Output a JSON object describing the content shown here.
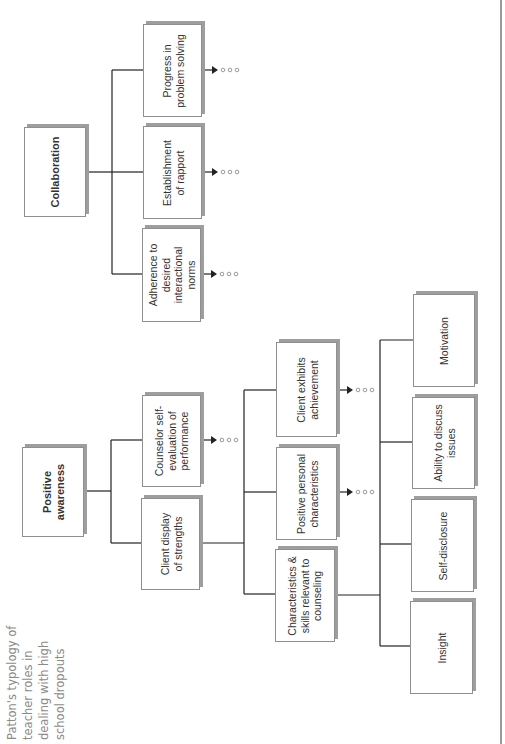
{
  "caption": "Patton's typology of teacher roles in dealing with high school dropouts",
  "diagram": {
    "orientation": "rotated-90-ccw",
    "trees": [
      {
        "root": "Collaboration",
        "children": [
          {
            "label": "Adherence to desired interactional norms",
            "continues": true
          },
          {
            "label": "Establishment of rapport",
            "continues": true
          },
          {
            "label": "Progress in problem solving",
            "continues": true
          }
        ]
      },
      {
        "root": "Positive awareness",
        "children": [
          {
            "label": "Client display of strengths",
            "children": [
              {
                "label": "Characteristics & skills relevant to counseling",
                "children": [
                  {
                    "label": "Insight"
                  },
                  {
                    "label": "Self-disclosure"
                  },
                  {
                    "label": "Ability to discuss issues"
                  },
                  {
                    "label": "Motivation"
                  }
                ]
              },
              {
                "label": "Positive personal characteristics",
                "continues": true
              },
              {
                "label": "Client exhibits achievement",
                "continues": true
              }
            ]
          },
          {
            "label": "Counselor self-evaluation of performance",
            "continues": true
          }
        ]
      }
    ]
  },
  "boxes": {
    "collaboration": "Collaboration",
    "progress": "Progress in problem solving",
    "rapport": "Establishment of rapport",
    "adherence": "Adherence to desired interactional norms",
    "positive_awareness": "Positive awareness",
    "counselor_self_eval": "Counselor self-evaluation of performance",
    "client_display": "Client display of strengths",
    "client_achievement": "Client exhibits achievement",
    "positive_personal": "Positive personal characteristics",
    "characteristics_skills": "Characteristics & skills relevant to counseling",
    "motivation": "Motivation",
    "ability_discuss": "Ability to discuss issues",
    "self_disclosure": "Self-disclosure",
    "insight": "Insight"
  },
  "continuation_marker": "• • •"
}
